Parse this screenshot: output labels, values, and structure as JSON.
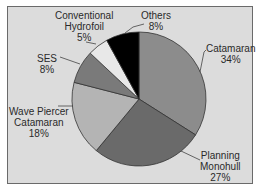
{
  "chart_data": {
    "type": "pie",
    "title": "",
    "categories": [
      "Catamaran",
      "Planning Monohull",
      "Wave Piercer Catamaran",
      "SES",
      "Conventional Hydrofoil",
      "Others"
    ],
    "values": [
      34,
      27,
      18,
      8,
      5,
      8
    ],
    "unit": "%",
    "start_angle": "12 o'clock",
    "direction": "clockwise",
    "colors": [
      "#8c8c8c",
      "#6a6a6a",
      "#b4b4b4",
      "#7a7a7a",
      "#e8e8e8",
      "#000000"
    ],
    "legend": "none (leader-line labels)"
  },
  "labels": [
    {
      "name": "Catamaran",
      "pct": "34%"
    },
    {
      "name": "Planning\nMonohull",
      "line1": "Planning",
      "line2": "Monohull",
      "pct": "27%"
    },
    {
      "name": "Wave Piercer Catamaran",
      "line1": "Wave Piercer",
      "line2": "Catamaran",
      "pct": "18%"
    },
    {
      "name": "SES",
      "pct": "8%"
    },
    {
      "name": "Conventional Hydrofoil",
      "line1": "Conventional",
      "line2": "Hydrofoil",
      "pct": "5%"
    },
    {
      "name": "Others",
      "pct": "8%"
    }
  ]
}
